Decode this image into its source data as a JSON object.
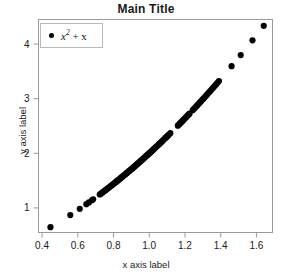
{
  "chart_data": {
    "type": "scatter",
    "title": "Main Title",
    "xlabel": "x axis label",
    "ylabel": "y axis label",
    "grid": false,
    "legend_position": "top-left",
    "legend": [
      {
        "label": "x^2 + x",
        "label_base": "x",
        "label_exponent": "2",
        "label_tail": "+ x",
        "marker": "filled-circle",
        "color": "#000000"
      }
    ],
    "xlim": [
      0.38,
      1.69
    ],
    "ylim": [
      0.55,
      4.45
    ],
    "xticks": [
      0.4,
      0.6,
      0.8,
      1.0,
      1.2,
      1.4,
      1.6
    ],
    "xticklabels": [
      "0.4",
      "0.6",
      "0.8",
      "1.0",
      "1.2",
      "1.4",
      "1.6"
    ],
    "yticks": [
      1,
      2,
      3,
      4
    ],
    "yticklabels": [
      "1",
      "2",
      "3",
      "4"
    ],
    "formula": "y = x^2 + x",
    "marker_size_px": 3.1,
    "marker_color": "#000000",
    "frame_color": "#9a9a9a",
    "series": [
      {
        "name": "x^2 + x",
        "x": [
          0.447,
          0.558,
          0.611,
          0.648,
          0.662,
          0.679,
          0.686,
          0.723,
          0.729,
          0.736,
          0.742,
          0.749,
          0.755,
          0.761,
          0.767,
          0.772,
          0.778,
          0.783,
          0.789,
          0.794,
          0.799,
          0.804,
          0.809,
          0.814,
          0.819,
          0.824,
          0.829,
          0.834,
          0.838,
          0.843,
          0.848,
          0.852,
          0.857,
          0.861,
          0.866,
          0.87,
          0.875,
          0.879,
          0.883,
          0.888,
          0.892,
          0.896,
          0.901,
          0.905,
          0.909,
          0.913,
          0.918,
          0.922,
          0.926,
          0.93,
          0.934,
          0.938,
          0.942,
          0.947,
          0.951,
          0.955,
          0.959,
          0.963,
          0.967,
          0.971,
          0.975,
          0.979,
          0.983,
          0.987,
          0.991,
          0.995,
          0.999,
          1.003,
          1.007,
          1.011,
          1.015,
          1.019,
          1.023,
          1.027,
          1.031,
          1.035,
          1.039,
          1.044,
          1.052,
          1.056,
          1.06,
          1.065,
          1.069,
          1.073,
          1.078,
          1.086,
          1.091,
          1.095,
          1.1,
          1.104,
          1.109,
          1.118,
          1.16,
          1.165,
          1.17,
          1.175,
          1.18,
          1.185,
          1.19,
          1.195,
          1.2,
          1.205,
          1.21,
          1.215,
          1.221,
          1.226,
          1.243,
          1.249,
          1.255,
          1.261,
          1.267,
          1.273,
          1.279,
          1.285,
          1.291,
          1.297,
          1.303,
          1.31,
          1.316,
          1.323,
          1.33,
          1.337,
          1.344,
          1.351,
          1.358,
          1.366,
          1.374,
          1.382,
          1.39,
          1.461,
          1.512,
          1.578,
          1.641
        ],
        "y_formula": "x*x + x"
      }
    ]
  }
}
